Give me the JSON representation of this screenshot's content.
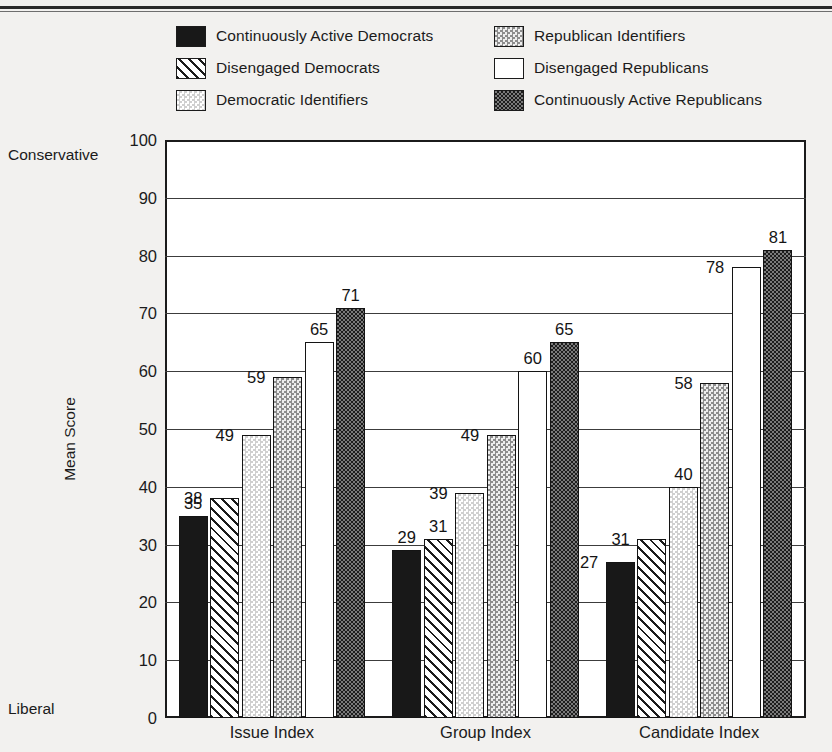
{
  "chart_data": {
    "type": "bar",
    "title": "",
    "xlabel": "",
    "ylabel": "Mean Score",
    "ylim": [
      0,
      100
    ],
    "yticks": [
      0,
      10,
      20,
      30,
      40,
      50,
      60,
      70,
      80,
      90,
      100
    ],
    "grid": true,
    "axis_endpoint_labels": {
      "top": "Conservative",
      "bottom": "Liberal"
    },
    "legend_position": "top",
    "categories": [
      "Issue Index",
      "Group Index",
      "Candidate Index"
    ],
    "series": [
      {
        "name": "Continuously Active Democrats",
        "pattern": "solid-black",
        "values": [
          35,
          29,
          27
        ]
      },
      {
        "name": "Disengaged Democrats",
        "pattern": "diagonal-hatch",
        "values": [
          38,
          31,
          31
        ]
      },
      {
        "name": "Democratic Identifiers",
        "pattern": "light-dots",
        "values": [
          49,
          39,
          40
        ]
      },
      {
        "name": "Republican Identifiers",
        "pattern": "medium-dots",
        "values": [
          59,
          49,
          58
        ]
      },
      {
        "name": "Disengaged Republicans",
        "pattern": "white",
        "values": [
          65,
          60,
          78
        ]
      },
      {
        "name": "Continuously Active Republicans",
        "pattern": "dark-dots",
        "values": [
          71,
          65,
          81
        ]
      }
    ]
  },
  "legend": {
    "items": [
      {
        "label": "Continuously Active Democrats",
        "pattern": "solid-black"
      },
      {
        "label": "Disengaged Democrats",
        "pattern": "diagonal-hatch"
      },
      {
        "label": "Democratic Identifiers",
        "pattern": "light-dots"
      },
      {
        "label": "Republican Identifiers",
        "pattern": "medium-dots"
      },
      {
        "label": "Disengaged Republicans",
        "pattern": "white"
      },
      {
        "label": "Continuously Active Republicans",
        "pattern": "dark-dots"
      }
    ]
  },
  "colors": {
    "background": "#f2f1ef",
    "plot_background": "#ffffff",
    "ink": "#1b1b1b",
    "gridline": "#3c3c3c"
  }
}
